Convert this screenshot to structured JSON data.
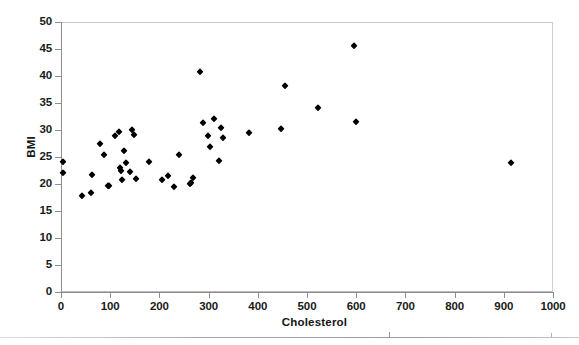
{
  "chart_data": {
    "type": "scatter",
    "title": "",
    "xlabel": "Cholesterol",
    "ylabel": "BMI",
    "xlim": [
      0,
      1000
    ],
    "ylim": [
      0,
      50
    ],
    "xticks": [
      0,
      100,
      200,
      300,
      400,
      500,
      600,
      700,
      800,
      900,
      1000
    ],
    "yticks": [
      0,
      5,
      10,
      15,
      20,
      25,
      30,
      35,
      40,
      45,
      50
    ],
    "xtick_labels": [
      "0",
      "100",
      "200",
      "300",
      "400",
      "500",
      "600",
      "700",
      "800",
      "900",
      "1000"
    ],
    "ytick_labels": [
      "0",
      "5",
      "10",
      "15",
      "20",
      "25",
      "30",
      "35",
      "40",
      "45",
      "50"
    ],
    "grid": false,
    "legend": false,
    "marker": "diamond",
    "marker_color": "#000000",
    "series": [
      {
        "name": "Subjects",
        "points": [
          [
            5,
            24.1
          ],
          [
            5,
            22.0
          ],
          [
            42,
            17.8
          ],
          [
            60,
            18.4
          ],
          [
            62,
            21.6
          ],
          [
            80,
            27.5
          ],
          [
            88,
            25.3
          ],
          [
            95,
            19.7
          ],
          [
            97,
            19.6
          ],
          [
            110,
            28.9
          ],
          [
            118,
            29.6
          ],
          [
            120,
            23.0
          ],
          [
            122,
            22.4
          ],
          [
            124,
            20.8
          ],
          [
            128,
            26.2
          ],
          [
            133,
            23.8
          ],
          [
            140,
            22.2
          ],
          [
            145,
            30.0
          ],
          [
            148,
            29.0
          ],
          [
            152,
            20.9
          ],
          [
            178,
            24.1
          ],
          [
            205,
            20.8
          ],
          [
            218,
            21.4
          ],
          [
            230,
            19.5
          ],
          [
            240,
            25.4
          ],
          [
            262,
            20.0
          ],
          [
            265,
            20.2
          ],
          [
            268,
            21.1
          ],
          [
            282,
            40.8
          ],
          [
            288,
            31.3
          ],
          [
            298,
            28.8
          ],
          [
            302,
            26.9
          ],
          [
            310,
            32.0
          ],
          [
            322,
            24.2
          ],
          [
            325,
            30.3
          ],
          [
            330,
            28.5
          ],
          [
            382,
            29.5
          ],
          [
            448,
            30.2
          ],
          [
            455,
            38.2
          ],
          [
            522,
            34.1
          ],
          [
            595,
            45.5
          ],
          [
            600,
            31.4
          ],
          [
            915,
            23.9
          ]
        ]
      }
    ]
  },
  "axis": {
    "y_title": "BMI",
    "x_title": "Cholesterol"
  }
}
